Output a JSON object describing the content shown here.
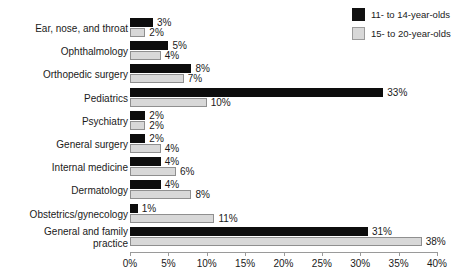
{
  "chart_data": {
    "type": "bar",
    "orientation": "horizontal",
    "title": "",
    "subtitle": "",
    "xlabel": "",
    "ylabel": "",
    "xlim": [
      0,
      40
    ],
    "xtick_labels": [
      "0%",
      "5%",
      "10%",
      "15%",
      "20%",
      "25%",
      "30%",
      "35%",
      "40%"
    ],
    "xtick_values": [
      0,
      5,
      10,
      15,
      20,
      25,
      30,
      35,
      40
    ],
    "grid": false,
    "legend_position": "top-right",
    "value_suffix": "%",
    "categories": [
      "Ear, nose, and throat",
      "Ophthalmology",
      "Orthopedic surgery",
      "Pediatrics",
      "Psychiatry",
      "General surgery",
      "Internal medicine",
      "Dermatology",
      "Obstetrics/gynecology",
      "General and family\npractice"
    ],
    "series": [
      {
        "name": "11- to 14-year-olds",
        "color": "#0d0d0d",
        "values": [
          3,
          5,
          8,
          33,
          2,
          2,
          4,
          4,
          1,
          31
        ],
        "labels": [
          "3%",
          "5%",
          "8%",
          "33%",
          "2%",
          "2%",
          "4%",
          "4%",
          "1%",
          "31%"
        ]
      },
      {
        "name": "15- to 20-year-olds",
        "color": "#d8d8d8",
        "values": [
          2,
          4,
          7,
          10,
          2,
          4,
          6,
          8,
          11,
          38
        ],
        "labels": [
          "2%",
          "4%",
          "7%",
          "10%",
          "2%",
          "4%",
          "6%",
          "8%",
          "11%",
          "38%"
        ]
      }
    ]
  },
  "legend": {
    "items": [
      {
        "label": "11- to 14-year-olds",
        "swatch": "dark"
      },
      {
        "label": "15- to 20-year-olds",
        "swatch": "light"
      }
    ]
  }
}
